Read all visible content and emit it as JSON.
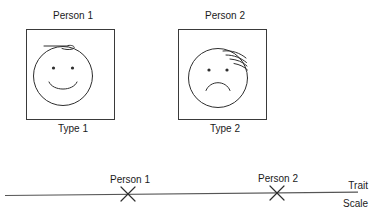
{
  "figure": {
    "type_boxes": [
      {
        "top_label": "Person 1",
        "bottom_label": "Type 1",
        "face": "smiling-face",
        "hair": "curl-hair"
      },
      {
        "top_label": "Person 2",
        "bottom_label": "Type 2",
        "face": "frowning-face",
        "hair": "spiky-hair"
      }
    ],
    "scale": {
      "axis_label_top": "Trait",
      "axis_label_bottom": "Scale",
      "marks": [
        {
          "label": "Person 1",
          "glyph": "x-mark"
        },
        {
          "label": "Person 2",
          "glyph": "x-mark"
        }
      ]
    },
    "colors": {
      "ink": "#2e2e2e",
      "axis": "#555555",
      "box_border": "#3a3a3a",
      "background": "#ffffff"
    }
  }
}
